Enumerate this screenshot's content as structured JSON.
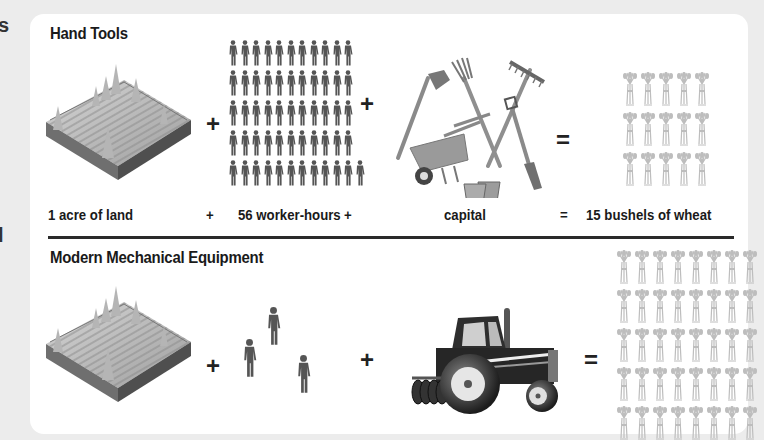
{
  "hand_tools": {
    "title": "Hand Tools",
    "illustrations": {
      "land": "acre-of-land-illustration",
      "workers": "worker-figures",
      "capital": "hand-tools-illustration",
      "output": "wheat-bundles"
    },
    "worker_count": 56,
    "workers_per_row": [
      11,
      11,
      11,
      11,
      12
    ],
    "wheat_count": 15,
    "wheat_rows": 3,
    "wheat_cols": 5,
    "operators": [
      "+",
      "+",
      "="
    ],
    "captions": {
      "land": "1 acre of land",
      "plus1": "+",
      "labor": "56 worker-hours",
      "plus2": "+",
      "capital": "capital",
      "equals": "=",
      "output": "15 bushels of wheat"
    }
  },
  "modern": {
    "title": "Modern Mechanical Equipment",
    "illustrations": {
      "land": "acre-of-land-illustration",
      "workers": "worker-figures",
      "capital": "tractor-illustration",
      "output": "wheat-bundles"
    },
    "worker_count": 3,
    "wheat_rows_visible": 5,
    "wheat_cols": 8,
    "operators": [
      "+",
      "+",
      "="
    ]
  },
  "edge_glyphs": [
    "s",
    "l"
  ],
  "colors": {
    "background": "#ececec",
    "card": "#ffffff",
    "text": "#1a1a1a",
    "figure": "#555555",
    "wheat": "#bdbdbd",
    "divider": "#2a2a2a"
  }
}
